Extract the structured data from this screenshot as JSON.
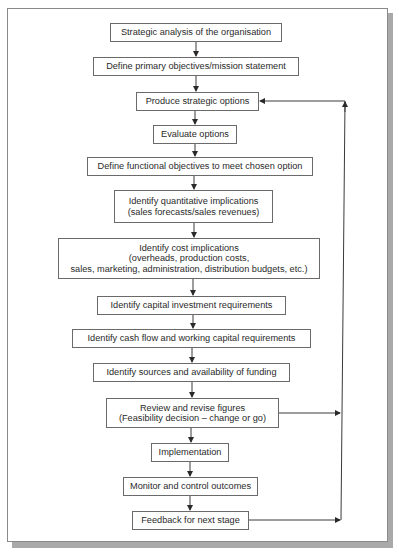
{
  "diagram": {
    "type": "flowchart",
    "steps": [
      {
        "id": "s1",
        "lines": [
          "Strategic analysis of the organisation"
        ]
      },
      {
        "id": "s2",
        "lines": [
          "Define primary objectives/mission statement"
        ]
      },
      {
        "id": "s3",
        "lines": [
          "Produce strategic options"
        ]
      },
      {
        "id": "s4",
        "lines": [
          "Evaluate options"
        ]
      },
      {
        "id": "s5",
        "lines": [
          "Define functional objectives to meet chosen option"
        ]
      },
      {
        "id": "s6",
        "lines": [
          "Identify quantitative implications",
          "(sales forecasts/sales revenues)"
        ]
      },
      {
        "id": "s7",
        "lines": [
          "Identify cost implications",
          "(overheads, production costs,",
          "sales, marketing, administration, distribution budgets, etc.)"
        ]
      },
      {
        "id": "s8",
        "lines": [
          "Identify capital investment requirements"
        ]
      },
      {
        "id": "s9",
        "lines": [
          "Identify cash flow and working capital requirements"
        ]
      },
      {
        "id": "s10",
        "lines": [
          "Identify sources and availability of funding"
        ]
      },
      {
        "id": "s11",
        "lines": [
          "Review and revise figures",
          "(Feasibility decision – change or go)"
        ]
      },
      {
        "id": "s12",
        "lines": [
          "Implementation"
        ]
      },
      {
        "id": "s13",
        "lines": [
          "Monitor and control outcomes"
        ]
      },
      {
        "id": "s14",
        "lines": [
          "Feedback for next stage"
        ]
      }
    ],
    "edges": [
      [
        "s1",
        "s2"
      ],
      [
        "s2",
        "s3"
      ],
      [
        "s3",
        "s4"
      ],
      [
        "s4",
        "s5"
      ],
      [
        "s5",
        "s6"
      ],
      [
        "s6",
        "s7"
      ],
      [
        "s7",
        "s8"
      ],
      [
        "s8",
        "s9"
      ],
      [
        "s9",
        "s10"
      ],
      [
        "s10",
        "s11"
      ],
      [
        "s11",
        "s12"
      ],
      [
        "s12",
        "s13"
      ],
      [
        "s13",
        "s14"
      ],
      [
        "s11",
        "s3"
      ],
      [
        "s14",
        "s3"
      ]
    ],
    "colors": {
      "line": "#3a3a3a",
      "box_border": "#6a6a6a",
      "frame_shadow": "#a9a9a9"
    }
  }
}
